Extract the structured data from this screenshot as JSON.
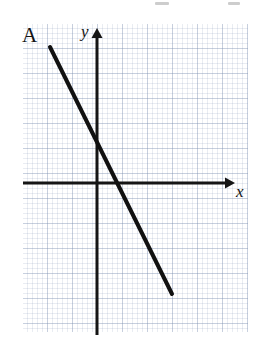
{
  "figure": {
    "kind": "coordinate-grid-line-graph",
    "background_color": "#ffffff",
    "grid": {
      "minor_cell_px": 5,
      "major_cell_px": 25,
      "color": "#8c9cb0",
      "left": 23,
      "top": 24,
      "width": 225,
      "height": 308
    }
  },
  "labels": {
    "line_label": "A",
    "y_axis_label": "y",
    "x_axis_label": "x"
  },
  "chart_data": {
    "type": "line",
    "title": "",
    "xlabel": "x",
    "ylabel": "y",
    "grid": true,
    "legend": "none",
    "annotations": [
      {
        "text": "A",
        "target": "line-A",
        "position": "upper-left-end-of-line"
      }
    ],
    "axes": {
      "origin_px": {
        "x": 97,
        "y": 183
      },
      "x_axis": {
        "from_px": 23,
        "to_px": 235,
        "arrow": "right",
        "y_px": 183
      },
      "y_axis": {
        "from_px": 335,
        "to_px": 30,
        "arrow": "up",
        "x_px": 97
      },
      "unit_px": 25,
      "xlim": [
        -3,
        5.5
      ],
      "ylim": [
        -6,
        6.2
      ]
    },
    "series": [
      {
        "name": "A",
        "color": "#111111",
        "line_width_px": 4,
        "slope": -2,
        "y_intercept": 3,
        "equation": "y = -2x + 3",
        "endpoints_px": [
          {
            "x": 50,
            "y": 47
          },
          {
            "x": 172,
            "y": 294
          }
        ],
        "endpoints_units": [
          {
            "x": -1.9,
            "y": 5.45
          },
          {
            "x": 3.0,
            "y": -4.45
          }
        ],
        "x_intercept_units": 1.5,
        "x_intercept_px": 135
      }
    ]
  }
}
